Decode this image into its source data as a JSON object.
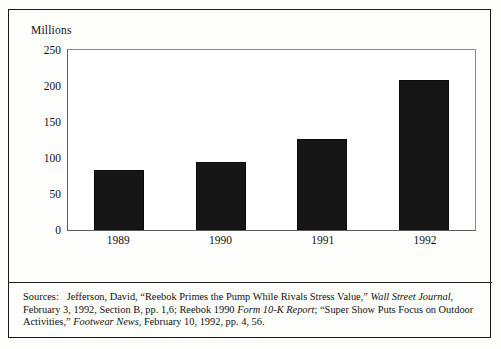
{
  "chart_data": {
    "type": "bar",
    "title": "",
    "subtitle": "",
    "xlabel": "",
    "ylabel": "Millions",
    "categories": [
      "1989",
      "1990",
      "1991",
      "1992"
    ],
    "values": [
      83,
      95,
      127,
      209
    ],
    "ylim": [
      0,
      250
    ],
    "yticks": [
      250,
      200,
      150,
      100,
      50,
      0
    ],
    "ytick_labels": [
      "250",
      "200",
      "150",
      "100",
      "50",
      "0"
    ],
    "grid": false,
    "legend": null,
    "bar_color": "#161616",
    "plot_background": "#ffffff"
  },
  "axis": {
    "unit_label": "Millions"
  },
  "sources": {
    "lead": "Sources:",
    "line1_a": "Jefferson, David, “Reebok Primes the Pump While Rivals Stress Value,” ",
    "line1_italic": "Wall Street Journal",
    "line1_b": ", February 3, 1992, Section B, pp. 1,6; Reebok 1990 ",
    "line2_italic": "Form 10-K Report",
    "line2_b": "; “Super Show Puts Focus on Outdoor Activities,” ",
    "line3_italic": "Footwear News",
    "line3_b": ", February 10, 1992, pp. 4, 56."
  }
}
